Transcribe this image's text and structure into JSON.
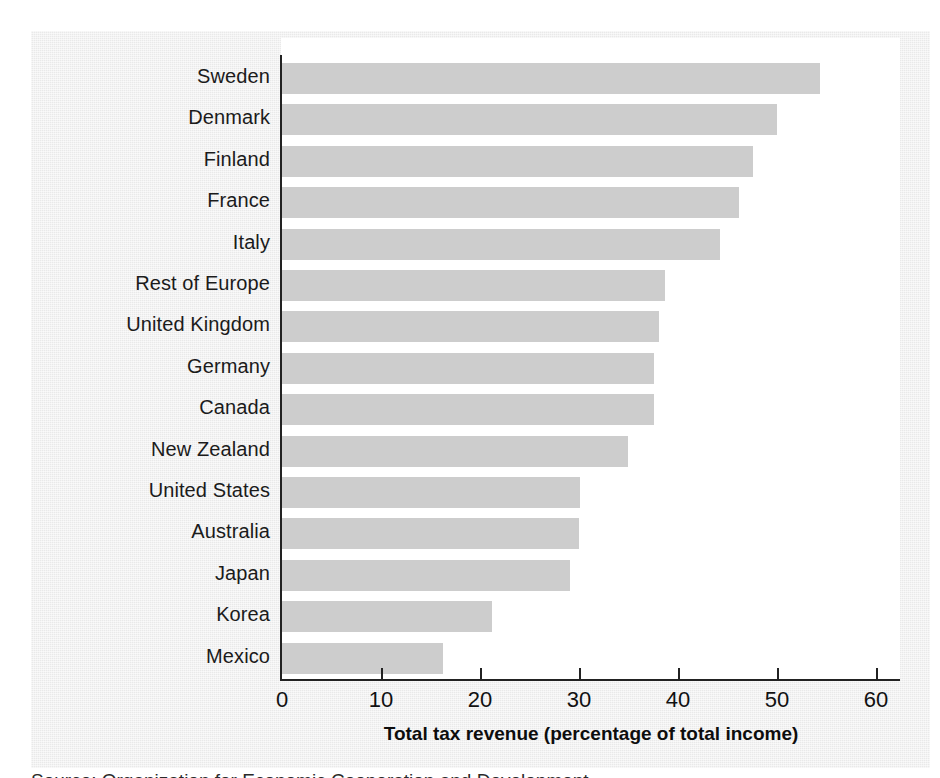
{
  "chart_data": {
    "type": "bar",
    "orientation": "horizontal",
    "title": "",
    "xlabel": "Total tax revenue (percentage of total income)",
    "ylabel": "",
    "xlim": [
      0,
      62
    ],
    "xticks": [
      0,
      10,
      20,
      30,
      40,
      50,
      60
    ],
    "xtick_labels": [
      "0",
      "10",
      "20",
      "30",
      "40",
      "50",
      "60"
    ],
    "grid": false,
    "legend": false,
    "bar_color": "#cdcdcd",
    "categories": [
      "Sweden",
      "Denmark",
      "Finland",
      "France",
      "Italy",
      "Rest of Europe",
      "United Kingdom",
      "Germany",
      "Canada",
      "New Zealand",
      "United States",
      "Australia",
      "Japan",
      "Korea",
      "Mexico"
    ],
    "values": [
      54.3,
      50.0,
      47.6,
      46.2,
      44.2,
      38.7,
      38.1,
      37.6,
      37.6,
      34.9,
      30.1,
      30.0,
      29.1,
      21.2,
      16.3
    ]
  },
  "axis": {
    "x_title": "Total tax revenue (percentage of total income)"
  },
  "caption": {
    "source": "Source: Organization for Economic Cooperation and Development"
  },
  "colors": {
    "panel_background": "#e9e9e9",
    "plot_background": "#ffffff",
    "bar_fill": "#cdcdcd",
    "axis_line": "#222222",
    "text": "#111111"
  }
}
